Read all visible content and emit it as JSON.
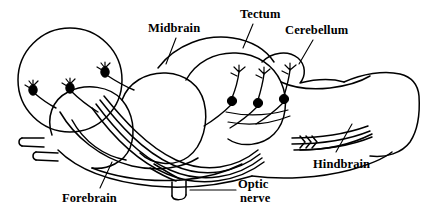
{
  "figure": {
    "background_color": "#ffffff",
    "stroke_color": "#000000"
  },
  "labels": {
    "midbrain": "Midbrain",
    "tectum": "Tectum",
    "cerebellum": "Cerebellum",
    "hindbrain": "Hindbrain",
    "forebrain": "Forebrain",
    "optic_nerve_line1": "Optic",
    "optic_nerve_line2": "nerve"
  },
  "diagram_parts": {
    "forebrain_inset_circle": "magnified-forebrain-circle",
    "forebrain_neurons": [
      "forebrain-neuron-1",
      "forebrain-neuron-2",
      "forebrain-neuron-3"
    ],
    "tectal_neurons": [
      "tectal-neuron-1",
      "tectal-neuron-2",
      "tectal-neuron-3"
    ],
    "olfactory_stalks": [
      "olfactory-stalk-upper",
      "olfactory-stalk-lower"
    ],
    "optic_nerve_stalk": "optic-nerve-stalk",
    "fiber_tract_bundle": "ascending-fiber-bundle",
    "spinal_cord": "hindbrain-spinal-cord"
  }
}
